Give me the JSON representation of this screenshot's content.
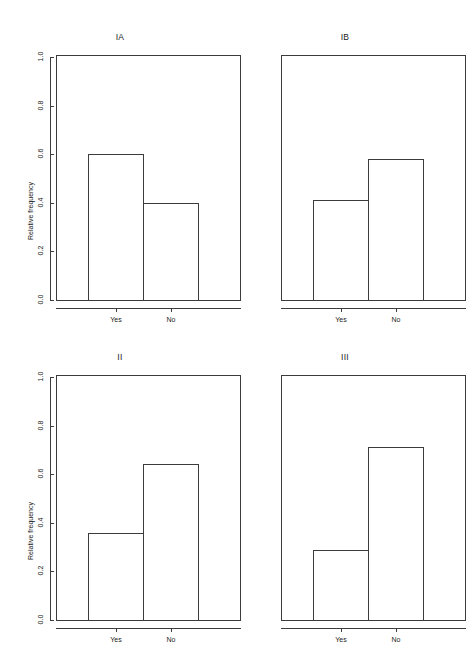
{
  "figure": {
    "background": "#ffffff",
    "line_color": "#3c3c3c",
    "width": 465,
    "height": 665
  },
  "axis": {
    "ylabel": "Relative frequency",
    "yticks": [
      "0.0",
      "0.2",
      "0.4",
      "0.6",
      "0.8",
      "1.0"
    ],
    "xcategories": [
      "Yes",
      "No"
    ]
  },
  "panels": [
    {
      "title": "IA",
      "values": [
        0.6,
        0.4
      ]
    },
    {
      "title": "IB",
      "values": [
        0.41,
        0.58
      ]
    },
    {
      "title": "II",
      "values": [
        0.36,
        0.64
      ]
    },
    {
      "title": "III",
      "values": [
        0.29,
        0.71
      ]
    }
  ],
  "chart_data": {
    "type": "bar",
    "title": "",
    "subtitle": "",
    "xlabel": "",
    "ylabel": "Relative frequency",
    "ylim": [
      0.0,
      1.0
    ],
    "ytick_values": [
      0.0,
      0.2,
      0.4,
      0.6,
      0.8,
      1.0
    ],
    "ytick_labels": [
      "0.0",
      "0.2",
      "0.4",
      "0.6",
      "0.8",
      "1.0"
    ],
    "grid": false,
    "legend": false,
    "legend_position": "none",
    "layout": "2x2 panel grid of relative-frequency bar charts",
    "categories": [
      "Yes",
      "No"
    ],
    "panels": [
      {
        "title": "IA",
        "categories": [
          "Yes",
          "No"
        ],
        "values": [
          0.6,
          0.4
        ]
      },
      {
        "title": "IB",
        "categories": [
          "Yes",
          "No"
        ],
        "values": [
          0.41,
          0.58
        ]
      },
      {
        "title": "II",
        "categories": [
          "Yes",
          "No"
        ],
        "values": [
          0.36,
          0.64
        ]
      },
      {
        "title": "III",
        "categories": [
          "Yes",
          "No"
        ],
        "values": [
          0.29,
          0.71
        ]
      }
    ],
    "annotations": [],
    "bar_style": {
      "fill": "none",
      "edge": "#3c3c3c",
      "edge_width": 1
    }
  }
}
